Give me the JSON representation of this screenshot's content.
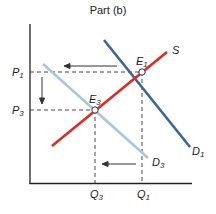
{
  "title": "Part (b)",
  "axes": {
    "price_labels": {
      "p1": "P",
      "p1_sub": "1",
      "p3": "P",
      "p3_sub": "3"
    },
    "quantity_labels": {
      "q3": "Q",
      "q3_sub": "3",
      "q1": "Q",
      "q1_sub": "1"
    }
  },
  "curves": {
    "supply": {
      "label": "S",
      "color": "#e02a1f"
    },
    "demand1": {
      "label": "D",
      "sub": "1",
      "color": "#3c6694"
    },
    "demand3": {
      "label": "D",
      "sub": "3",
      "color": "#a9c6df"
    }
  },
  "points": {
    "e1": {
      "label": "E",
      "sub": "1"
    },
    "e3": {
      "label": "E",
      "sub": "3"
    }
  }
}
